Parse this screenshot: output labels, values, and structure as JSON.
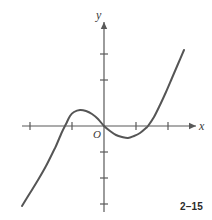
{
  "figure": {
    "number_label": "2–15",
    "background_color": "#ffffff",
    "axis_color": "#595959",
    "curve_color": "#555555",
    "label_color": "#3a3a3a"
  },
  "axes": {
    "y_label": "y",
    "x_label": "x",
    "origin_label": "O",
    "x_axis": {
      "pixel_y": 126,
      "start_x": 22,
      "end_x": 196,
      "arrow": "right",
      "tick_pixels": [
        30,
        72,
        136,
        168
      ],
      "tick_half_length": 4
    },
    "y_axis": {
      "pixel_x": 104,
      "start_y": 212,
      "end_y": 22,
      "arrow": "up",
      "tick_pixels": [
        54,
        80,
        152,
        178,
        204
      ],
      "tick_half_length": 4
    }
  },
  "chart_data": {
    "type": "line",
    "title": "",
    "xlabel": "x",
    "ylabel": "y",
    "grid": false,
    "legend": null,
    "annotations": [
      "O",
      "2–15"
    ],
    "curve_description": "cubic polynomial with local maximum left of the y-axis, local minimum right of the y-axis, and three x-intercepts",
    "axis_ranges": {
      "x_pixels": [
        22,
        196
      ],
      "y_pixels": [
        22,
        212
      ],
      "origin_pixel": [
        104,
        126
      ],
      "tick_spacing_pixels": 32
    },
    "x_intercepts_pixels": [
      56,
      104,
      148
    ],
    "local_extrema_pixels": {
      "local_max": [
        72,
        112
      ],
      "local_min": [
        127,
        138
      ]
    },
    "endpoints_pixels": {
      "lower_left": [
        22,
        206
      ],
      "upper_right": [
        184,
        50
      ]
    },
    "path_points_pixels": [
      [
        22,
        206
      ],
      [
        30,
        193
      ],
      [
        38,
        180
      ],
      [
        46,
        166
      ],
      [
        54,
        150
      ],
      [
        56,
        146
      ],
      [
        62,
        132
      ],
      [
        66,
        124
      ],
      [
        70,
        116
      ],
      [
        74,
        112
      ],
      [
        80,
        110
      ],
      [
        86,
        111
      ],
      [
        92,
        114
      ],
      [
        98,
        119
      ],
      [
        104,
        126
      ],
      [
        110,
        131
      ],
      [
        116,
        135
      ],
      [
        122,
        137
      ],
      [
        128,
        138
      ],
      [
        134,
        136
      ],
      [
        140,
        133
      ],
      [
        146,
        128
      ],
      [
        148,
        126
      ],
      [
        154,
        117
      ],
      [
        160,
        105
      ],
      [
        166,
        92
      ],
      [
        172,
        78
      ],
      [
        178,
        64
      ],
      [
        184,
        50
      ]
    ],
    "stroke_width_px": 2
  }
}
